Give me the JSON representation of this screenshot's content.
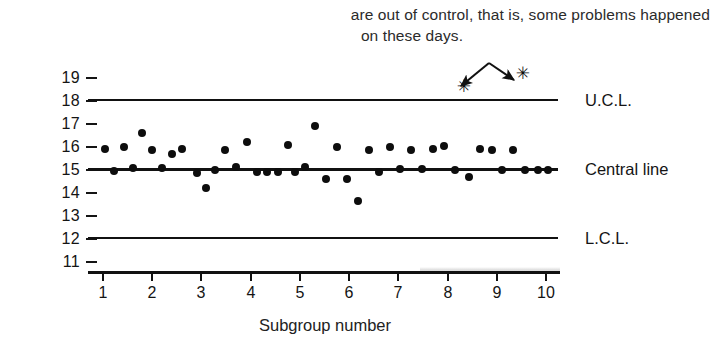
{
  "caption": {
    "line1": "are out of control, that is, some problems happened",
    "line2": "on these days."
  },
  "axis": {
    "x_title": "Subgroup number",
    "x_labels": [
      "1",
      "2",
      "3",
      "4",
      "5",
      "6",
      "7",
      "8",
      "9",
      "10"
    ],
    "y_labels": [
      "19",
      "18",
      "17",
      "16",
      "15",
      "14",
      "13",
      "12",
      "11"
    ]
  },
  "line_labels": {
    "ucl": "U.C.L.",
    "central": "Central line",
    "lcl": "L.C.L."
  },
  "colors": {
    "ink": "#111111",
    "text": "#1a1a1a",
    "marker": "#0d0d0d"
  },
  "chart_data": {
    "type": "scatter",
    "title": "",
    "xlabel": "Subgroup number",
    "ylabel": "",
    "xlim": [
      0.7,
      10.3
    ],
    "ylim": [
      11,
      19
    ],
    "grid": false,
    "legend": "none",
    "control_limits": {
      "ucl": 18,
      "central_line": 15,
      "lcl": 12
    },
    "series": [
      {
        "name": "Subgroup average",
        "x": [
          1.05,
          1.25,
          1.45,
          1.62,
          1.82,
          2.02,
          2.22,
          2.42,
          2.62,
          2.92,
          3.12,
          3.3,
          3.5,
          3.72,
          3.95,
          4.15,
          4.35,
          4.58,
          4.78,
          4.92,
          5.12,
          5.32,
          5.55,
          5.78,
          5.98,
          6.2,
          6.42,
          6.62,
          6.85,
          7.05,
          7.28,
          7.5,
          7.72,
          7.95,
          8.18,
          8.45,
          8.68,
          8.92,
          9.12,
          9.35,
          9.6,
          9.85,
          10.05
        ],
        "y": [
          15.9,
          14.95,
          16.0,
          15.1,
          16.6,
          15.85,
          15.1,
          15.7,
          15.9,
          14.85,
          14.2,
          15.0,
          15.85,
          15.15,
          16.2,
          14.9,
          14.9,
          14.9,
          16.1,
          14.9,
          15.15,
          16.9,
          14.6,
          16.0,
          14.6,
          13.65,
          15.85,
          14.9,
          16.0,
          15.05,
          15.85,
          15.05,
          15.9,
          16.05,
          15.0,
          14.7,
          15.9,
          15.85,
          15.0,
          15.85,
          15.0,
          15.0,
          15.0
        ]
      },
      {
        "name": "Out-of-control points",
        "marker": "asterisk",
        "x": [
          8.35,
          9.55
        ],
        "y": [
          18.65,
          19.2
        ]
      }
    ],
    "annotations": [
      {
        "text": "are out of control, that is, some problems happened on these days.",
        "points_to": [
          [
            8.35,
            18.65
          ],
          [
            9.55,
            19.2
          ]
        ]
      }
    ]
  }
}
